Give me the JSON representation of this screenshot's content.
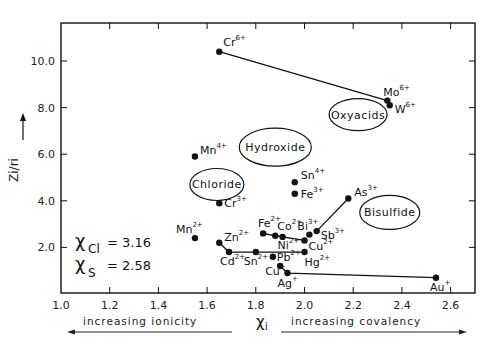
{
  "chart_data": {
    "type": "scatter",
    "title": "",
    "xlabel": "χi",
    "ylabel": "Zi/ri",
    "xlim": [
      1.0,
      2.7
    ],
    "ylim": [
      0.0,
      11.5
    ],
    "x_ticks": [
      "1.0",
      "1.2",
      "1.4",
      "1.6",
      "1.8",
      "2.0",
      "2.2",
      "2.4",
      "2.6"
    ],
    "y_ticks": [
      "2.0",
      "4.0",
      "6.0",
      "8.0",
      "10.0"
    ],
    "grid": false,
    "points": [
      {
        "label": "Cr",
        "charge": "6+",
        "x": 1.65,
        "y": 10.4
      },
      {
        "label": "Mo",
        "charge": "6+",
        "x": 2.34,
        "y": 8.3
      },
      {
        "label": "W",
        "charge": "6+",
        "x": 2.35,
        "y": 8.1
      },
      {
        "label": "Mn",
        "charge": "4+",
        "x": 1.55,
        "y": 5.9
      },
      {
        "label": "Sn",
        "charge": "4+",
        "x": 1.96,
        "y": 4.8
      },
      {
        "label": "Fe",
        "charge": "3+",
        "x": 1.96,
        "y": 4.3
      },
      {
        "label": "Cr",
        "charge": "3+",
        "x": 1.65,
        "y": 3.9
      },
      {
        "label": "As",
        "charge": "3+",
        "x": 2.18,
        "y": 4.1
      },
      {
        "label": "Sb",
        "charge": "3+",
        "x": 2.05,
        "y": 2.7
      },
      {
        "label": "Bi",
        "charge": "3+",
        "x": 2.02,
        "y": 2.55
      },
      {
        "label": "Fe",
        "charge": "2+",
        "x": 1.83,
        "y": 2.6
      },
      {
        "label": "Co",
        "charge": "2+",
        "x": 1.88,
        "y": 2.5
      },
      {
        "label": "Ni",
        "charge": "2+",
        "x": 1.91,
        "y": 2.45
      },
      {
        "label": "Cu",
        "charge": "2+",
        "x": 2.0,
        "y": 2.3
      },
      {
        "label": "Mn",
        "charge": "2+",
        "x": 1.55,
        "y": 2.4
      },
      {
        "label": "Zn",
        "charge": "2+",
        "x": 1.65,
        "y": 2.2
      },
      {
        "label": "Cd",
        "charge": "2+",
        "x": 1.69,
        "y": 1.8
      },
      {
        "label": "Sn",
        "charge": "2+",
        "x": 1.8,
        "y": 1.8
      },
      {
        "label": "Pb",
        "charge": "2+",
        "x": 1.87,
        "y": 1.6
      },
      {
        "label": "Hg",
        "charge": "2+",
        "x": 2.0,
        "y": 1.8
      },
      {
        "label": "Cu",
        "charge": "+",
        "x": 1.9,
        "y": 1.2
      },
      {
        "label": "Ag",
        "charge": "+",
        "x": 1.93,
        "y": 0.9
      },
      {
        "label": "Au",
        "charge": "+",
        "x": 2.54,
        "y": 0.7
      }
    ],
    "connecting_lines": [
      [
        "Cr6+",
        "Mo6+"
      ],
      [
        "Sb3+",
        "As3+"
      ],
      [
        "Fe2+",
        "Co2+",
        "Ni2+",
        "Cu2+"
      ],
      [
        "Zn2+",
        "Cd2+",
        "Sn2+",
        "Hg2+"
      ],
      [
        "Cu+",
        "Ag+",
        "Au+"
      ]
    ],
    "regions": [
      {
        "label": "Oxyacids",
        "cx": 2.22,
        "cy": 7.7
      },
      {
        "label": "Hydroxide",
        "cx": 1.88,
        "cy": 6.3
      },
      {
        "label": "Chloride",
        "cx": 1.64,
        "cy": 4.7
      },
      {
        "label": "Bisulfide",
        "cx": 2.35,
        "cy": 3.5
      }
    ],
    "annotations": [
      {
        "text": "χCl = 3.16"
      },
      {
        "text": "χS = 2.58"
      },
      {
        "text": "increasing ionicity",
        "direction": "left"
      },
      {
        "text": "increasing covalency",
        "direction": "right"
      }
    ]
  },
  "labels": {
    "xlabel_main": "χ",
    "xlabel_sub": "i",
    "ylabel": "Zi/ri",
    "chi_cl_symbol": "χ",
    "chi_cl_sub": "Cl",
    "chi_cl_value": "= 3.16",
    "chi_s_symbol": "χ",
    "chi_s_sub": "S",
    "chi_s_value": "= 2.58",
    "ionicity": "increasing ionicity",
    "covalency": "increasing covalency"
  }
}
